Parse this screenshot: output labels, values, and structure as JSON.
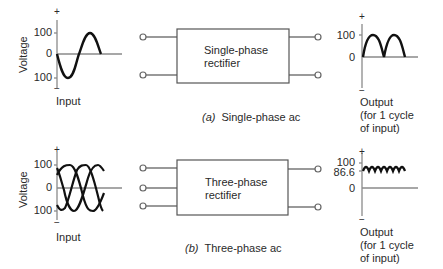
{
  "panels": [
    {
      "id": "a",
      "caption_letter": "(a)",
      "caption_text": "Single-phase ac",
      "input": {
        "ylabel": "Voltage",
        "plus": "+",
        "minus": "−",
        "ticks": [
          "100",
          "0",
          "100"
        ],
        "label": "Input"
      },
      "rectifier": {
        "line1": "Single-phase",
        "line2": "rectifier",
        "inputs": 2,
        "outputs": 2
      },
      "output": {
        "plus": "+",
        "minus": "−",
        "ticks": [
          "100",
          "0"
        ],
        "label_line1": "Output",
        "label_line2": "(for 1 cycle",
        "label_line3": "of input)"
      }
    },
    {
      "id": "b",
      "caption_letter": "(b)",
      "caption_text": "Three-phase ac",
      "input": {
        "ylabel": "Voltage",
        "plus": "+",
        "minus": "−",
        "ticks": [
          "100",
          "0",
          "100"
        ],
        "label": "Input"
      },
      "rectifier": {
        "line1": "Three-phase",
        "line2": "rectifier",
        "inputs": 3,
        "outputs": 2
      },
      "output": {
        "plus": "+",
        "minus": "−",
        "ticks": [
          "100",
          "86.6",
          "0"
        ],
        "label_line1": "Output",
        "label_line2": "(for 1 cycle",
        "label_line3": "of input)"
      }
    }
  ],
  "colors": {
    "axis": "#8a8a8a",
    "waveform": "#111111",
    "box": "#555555",
    "text": "#2a2a2a"
  }
}
